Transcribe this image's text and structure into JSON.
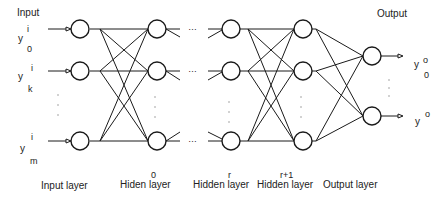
{
  "title_input": "Input",
  "title_output": "Output",
  "inputs": [
    {
      "base": "y",
      "sup": "i",
      "sub": "0"
    },
    {
      "base": "y",
      "sup": "i",
      "sub": "k"
    },
    {
      "base": "y",
      "sup": "i",
      "sub": "m"
    }
  ],
  "outputs": [
    {
      "base": "y",
      "sup": "o",
      "sub": "0"
    },
    {
      "base": "y",
      "sup": "o",
      "sub": ""
    }
  ],
  "ellipsis": "…",
  "layers": [
    {
      "index": "",
      "label": "Input layer"
    },
    {
      "index": "0",
      "label": "Hiden layer"
    },
    {
      "index": "r",
      "label": "Hidden layer"
    },
    {
      "index": "r+1",
      "label": "Hidden layer"
    },
    {
      "index": "",
      "label": "Output layer"
    }
  ],
  "colors": {
    "stroke": "#1a1a1a",
    "text": "#222222"
  }
}
